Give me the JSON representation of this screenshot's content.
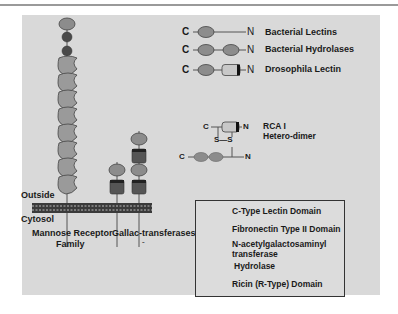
{
  "diagram": {
    "type": "protein-domain-schematic",
    "colors": {
      "panel_bg": "#d9d9d9",
      "lectin_domain": "#9a9a9a",
      "fibronectin_domain": "#4a4a4a",
      "transferase_domain": "#555555",
      "hydrolase_domain": "#c8c8c8",
      "ricin_domain": "#8c8c8c",
      "membrane": "#333333"
    },
    "membrane": {
      "outside_label": "Outside",
      "cytosol_label": "Cytosol"
    },
    "left_proteins": [
      {
        "label_line1": "Mannose Receptor",
        "label_line2": "Family",
        "domains": [
          "Ricin (R-Type)",
          "Fibronectin Type II",
          "Fibronectin Type II",
          "C-Type Lectin x8"
        ]
      },
      {
        "label_line1": "Gallac-transferases",
        "label_line2": "-",
        "domains": [
          "Ricin (R-Type)",
          "N-acetylgalactosaminyl transferase",
          "Ricin (R-Type)",
          "N-acetylgalactosaminyl transferase"
        ]
      }
    ],
    "right_proteins": [
      {
        "c_label": "C",
        "n_label": "N",
        "name": "Bacterial Lectins"
      },
      {
        "c_label": "C",
        "n_label": "N",
        "name": "Bacterial Hydrolases"
      },
      {
        "c_label": "C",
        "n_label": "N",
        "name": "Drosophila Lectin"
      },
      {
        "c_label": "C",
        "n_label": "N",
        "name_line1": "RCA I",
        "name_line2": "Hetero-dimer",
        "disulfide": "S—S"
      }
    ],
    "legend": [
      {
        "icon": "c-type-lectin-icon",
        "label": "C-Type Lectin Domain"
      },
      {
        "icon": "fibronectin-icon",
        "label": "Fibronectin Type II Domain"
      },
      {
        "icon": "transferase-icon",
        "label_line1": "N-acetylgalactosaminyl",
        "label_line2": "transferase"
      },
      {
        "icon": "hydrolase-icon",
        "label": "Hydrolase"
      },
      {
        "icon": "ricin-icon",
        "label": "Ricin (R-Type) Domain"
      }
    ]
  }
}
